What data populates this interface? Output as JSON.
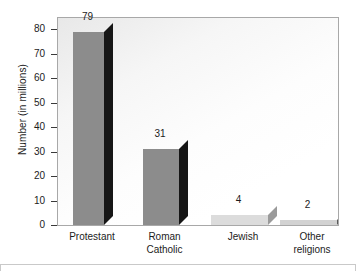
{
  "chart_data": {
    "type": "bar",
    "title": "",
    "subtitle": "",
    "xlabel": "",
    "ylabel": "Number (in millions)",
    "categories": [
      "Protestant",
      "Roman Catholic",
      "Jewish",
      "Other religions"
    ],
    "category_lines": [
      [
        "Protestant"
      ],
      [
        "Roman",
        "Catholic"
      ],
      [
        "Jewish"
      ],
      [
        "Other",
        "religions"
      ]
    ],
    "values": [
      79,
      31,
      4,
      2
    ],
    "value_labels": [
      "79",
      "31",
      "4",
      "2"
    ],
    "ylim": [
      0,
      85
    ],
    "yticks": [
      0,
      10,
      20,
      30,
      40,
      50,
      60,
      70,
      80
    ],
    "ytick_labels": [
      "0",
      "10",
      "20",
      "30",
      "40",
      "50",
      "60",
      "70",
      "80"
    ],
    "grid": false,
    "legend": null,
    "style": "3d-bar",
    "bar_colors": [
      "#8c8c8c",
      "#8c8c8c",
      "#dcdcdc",
      "#d2d2d2"
    ],
    "bar_side_colors": [
      "#161616",
      "#161616",
      "#9a9a9a",
      "#5a5a5a"
    ],
    "bar_top_colors": [
      "#4a4a4a",
      "#4a4a4a",
      "#bdbdbd",
      "#8f8f8f"
    ],
    "plot_border_color": "#a8a8a8",
    "axis_color": "#3a3a3a",
    "text_color": "#1c1c1c",
    "background": "#ffffff"
  }
}
